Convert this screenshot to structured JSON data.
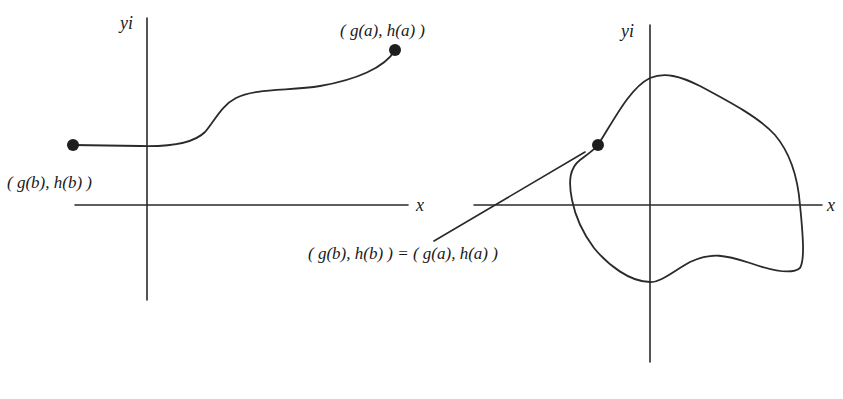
{
  "figure": {
    "style": {
      "ink_color": "#2a2a2a",
      "background": "#ffffff"
    },
    "left_panel": {
      "y_axis_label": "yi",
      "x_axis_label": "x",
      "start_point_label": "( g(b), h(b) )",
      "end_point_label": "( g(a), h(a) )",
      "curve_type": "open curve from (g(b),h(b)) to (g(a),h(a))"
    },
    "right_panel": {
      "y_axis_label": "yi",
      "x_axis_label": "x",
      "point_label": "( g(b), h(b) ) = ( g(a), h(a) )",
      "curve_type": "closed curve (start point equals end point)"
    }
  }
}
